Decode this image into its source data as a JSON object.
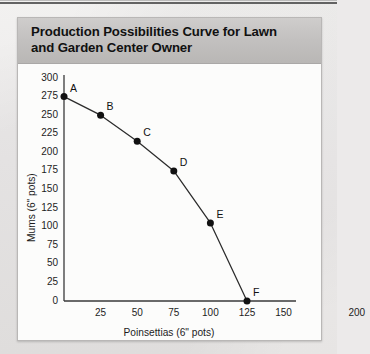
{
  "page": {
    "background_color": "#eceaea",
    "title_band_color": "#bfbfbf",
    "plot_background_color": "#fcfcfb"
  },
  "figure": {
    "title_line1": "Production Possibilities Curve for Lawn",
    "title_line2": "and Garden Center Owner"
  },
  "chart_data": {
    "type": "line",
    "title": "Production Possibilities Curve for Lawn and Garden Center Owner",
    "xlabel": "Poinsettias (6\" pots)",
    "ylabel": "Mums (6\" pots)",
    "xlim": [
      0,
      200
    ],
    "ylim": [
      0,
      300
    ],
    "xticks": [
      0,
      25,
      50,
      75,
      100,
      125,
      150,
      175,
      200
    ],
    "xticklabels": [
      "",
      "25",
      "50",
      "75",
      "100",
      "125",
      "150",
      "",
      "200"
    ],
    "yticks": [
      0,
      25,
      50,
      75,
      100,
      125,
      150,
      175,
      200,
      225,
      250,
      275,
      300
    ],
    "yticklabels": [
      "0",
      "25",
      "50",
      "75",
      "100",
      "125",
      "150",
      "175",
      "200",
      "225",
      "250",
      "275",
      "300"
    ],
    "grid": false,
    "legend": false,
    "marker": "filled-circle",
    "line_color": "#2b2b2b",
    "marker_color": "#111111",
    "series": [
      {
        "name": "Production Possibilities Curve",
        "points": [
          {
            "label": "A",
            "x": 0,
            "y": 275
          },
          {
            "label": "B",
            "x": 25,
            "y": 250
          },
          {
            "label": "C",
            "x": 50,
            "y": 215
          },
          {
            "label": "D",
            "x": 75,
            "y": 175
          },
          {
            "label": "E",
            "x": 100,
            "y": 105
          },
          {
            "label": "F",
            "x": 125,
            "y": 0
          }
        ]
      }
    ],
    "point_labels": [
      "A",
      "B",
      "C",
      "D",
      "E",
      "F"
    ],
    "x": [
      0,
      25,
      50,
      75,
      100,
      125
    ],
    "values": [
      275,
      250,
      215,
      175,
      105,
      0
    ]
  }
}
